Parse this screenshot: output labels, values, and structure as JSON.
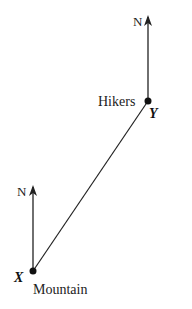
{
  "diagram": {
    "type": "bearing-diagram",
    "points": {
      "x": {
        "label": "X",
        "caption": "Mountain"
      },
      "y": {
        "label": "Y",
        "caption": "Hikers"
      }
    },
    "north_labels": {
      "at_x": "N",
      "at_y": "N"
    },
    "colors": {
      "line": "#222222",
      "background": "#ffffff"
    }
  }
}
